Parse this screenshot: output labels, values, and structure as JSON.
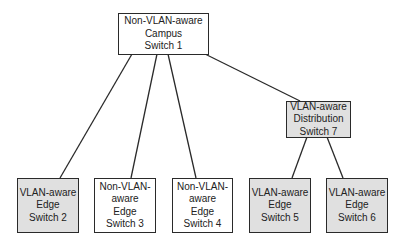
{
  "diagram": {
    "type": "network-topology",
    "colors": {
      "vlan_aware_fill": "#e0e0e0",
      "non_vlan_aware_fill": "#ffffff",
      "line": "#2a2a2a"
    },
    "nodes": [
      {
        "id": "s1",
        "lines": [
          "Non-VLAN-aware",
          "Campus",
          "Switch 1"
        ],
        "vlan_aware": false
      },
      {
        "id": "s7",
        "lines": [
          "VLAN-aware",
          "Distribution",
          "Switch 7"
        ],
        "vlan_aware": true
      },
      {
        "id": "s2",
        "lines": [
          "VLAN-aware",
          "Edge",
          "Switch 2"
        ],
        "vlan_aware": true
      },
      {
        "id": "s3",
        "lines": [
          "Non-VLAN-",
          "aware",
          "Edge",
          "Switch 3"
        ],
        "vlan_aware": false
      },
      {
        "id": "s4",
        "lines": [
          "Non-VLAN-",
          "aware",
          "Edge",
          "Switch 4"
        ],
        "vlan_aware": false
      },
      {
        "id": "s5",
        "lines": [
          "VLAN-aware",
          "Edge",
          "Switch 5"
        ],
        "vlan_aware": true
      },
      {
        "id": "s6",
        "lines": [
          "VLAN-aware",
          "Edge",
          "Switch 6"
        ],
        "vlan_aware": true
      }
    ],
    "edges": [
      [
        "s1",
        "s2"
      ],
      [
        "s1",
        "s3"
      ],
      [
        "s1",
        "s4"
      ],
      [
        "s1",
        "s7"
      ],
      [
        "s7",
        "s5"
      ],
      [
        "s7",
        "s6"
      ]
    ]
  }
}
